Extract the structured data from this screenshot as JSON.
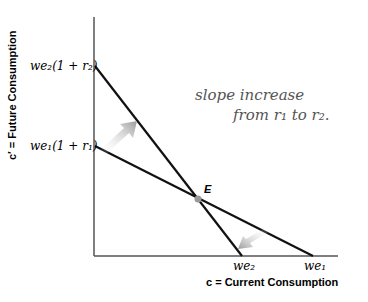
{
  "diagram": {
    "type": "intertemporal budget constraint",
    "y_axis_label": "c′ = Future Consumption",
    "x_axis_label": "c = Current Consumption",
    "y_ticks": {
      "upper": "we₂(1 + r₂)",
      "lower": "we₁(1 + r₁)"
    },
    "x_ticks": {
      "left": "we₂",
      "right": "we₁"
    },
    "intersection_label": "E",
    "annotation_line1": "slope increase",
    "annotation_line2": "from r₁ to r₂.",
    "lines": [
      {
        "name": "budget-line-r1",
        "from_label": "we₁(1 + r₁)",
        "to_label": "we₁"
      },
      {
        "name": "budget-line-r2",
        "from_label": "we₂(1 + r₂)",
        "to_label": "we₂"
      }
    ],
    "arrows": [
      {
        "name": "shift-up-arrow",
        "direction": "up-right"
      },
      {
        "name": "shift-down-arrow",
        "direction": "down-left"
      }
    ],
    "colors": {
      "axis": "#555555",
      "line": "#111111",
      "arrow": "#b0b0b0",
      "handwriting": "#555555"
    }
  }
}
